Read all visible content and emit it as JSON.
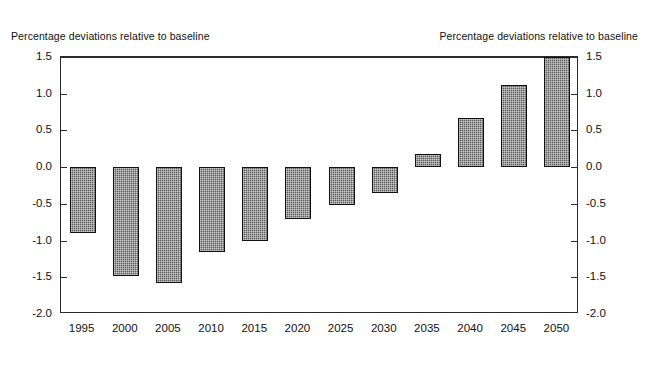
{
  "captions": {
    "left": "Percentage deviations relative to baseline",
    "right": "Percentage deviations relative to baseline"
  },
  "chart_data": {
    "type": "bar",
    "title": "",
    "subtitle": "",
    "xlabel": "",
    "ylabel": "Percentage deviations relative to baseline",
    "ylabel_right": "Percentage deviations relative to baseline",
    "categories": [
      "1995",
      "2000",
      "2005",
      "2010",
      "2015",
      "2020",
      "2025",
      "2030",
      "2035",
      "2040",
      "2045",
      "2050"
    ],
    "values": [
      -0.9,
      -1.48,
      -1.58,
      -1.15,
      -1.0,
      -0.7,
      -0.52,
      -0.35,
      0.18,
      0.67,
      1.12,
      1.5
    ],
    "ylim": [
      -2.0,
      1.5
    ],
    "yticks": [
      "1.5",
      "1.0",
      "0.5",
      "0.0",
      "-0.5",
      "-1.0",
      "-1.5",
      "-2.0"
    ],
    "ytick_values": [
      1.5,
      1.0,
      0.5,
      0.0,
      -0.5,
      -1.0,
      -1.5,
      -2.0
    ],
    "yticks_right": [
      "1.5",
      "1.0",
      "0.5",
      "0.0",
      "-0.5",
      "-1.0",
      "-1.5",
      "-2.0"
    ],
    "grid": false,
    "legend": null,
    "legend_position": "none",
    "series": [
      {
        "name": "Percentage deviation from baseline",
        "values": [
          -0.9,
          -1.48,
          -1.58,
          -1.15,
          -1.0,
          -0.7,
          -0.52,
          -0.35,
          0.18,
          0.67,
          1.12,
          1.5
        ]
      }
    ],
    "bar_color": "#5e5e5e",
    "bar_edge_color": "#111111",
    "axis_color": "#2b2b2b"
  }
}
